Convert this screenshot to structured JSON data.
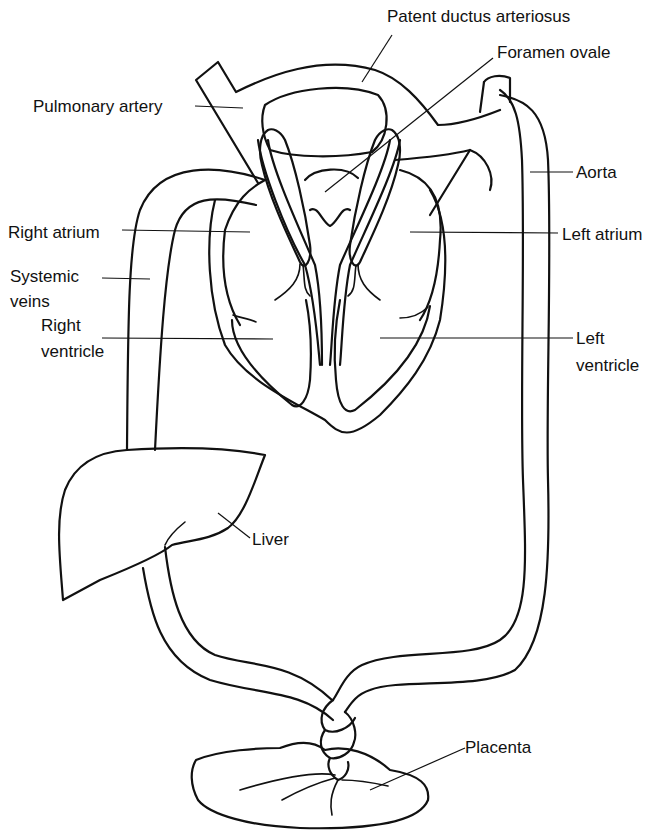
{
  "diagram": {
    "labels": {
      "patent_ductus_arteriosus": "Patent ductus arteriosus",
      "foramen_ovale": "Foramen ovale",
      "pulmonary_artery": "Pulmonary artery",
      "aorta": "Aorta",
      "right_atrium": "Right atrium",
      "left_atrium": "Left atrium",
      "systemic_veins_line1": "Systemic",
      "systemic_veins_line2": "veins",
      "right_ventricle_line1": "Right",
      "right_ventricle_line2": "ventricle",
      "left_ventricle_line1": "Left",
      "left_ventricle_line2": "ventricle",
      "liver": "Liver",
      "placenta": "Placenta"
    },
    "colors": {
      "ink": "#111111",
      "background": "#ffffff"
    }
  }
}
